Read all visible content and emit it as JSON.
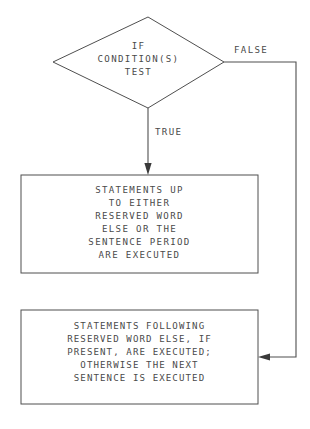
{
  "diagram": {
    "type": "flowchart",
    "background_color": "#ffffff",
    "line_color": "#4f4f4f",
    "text_color": "#4a4a4a",
    "decision": {
      "shape": "diamond",
      "lines": [
        "IF",
        "CONDITION(S)",
        "TEST"
      ],
      "text": "IF\nCONDITION(S)\nTEST"
    },
    "edges": {
      "true_label": "TRUE",
      "false_label": "FALSE"
    },
    "process_top": {
      "shape": "rectangle",
      "lines": [
        "STATEMENTS UP",
        "TO EITHER",
        "RESERVED WORD",
        "ELSE OR THE",
        "SENTENCE PERIOD",
        "ARE EXECUTED"
      ],
      "text": "STATEMENTS UP\nTO EITHER\nRESERVED WORD\nELSE OR THE\nSENTENCE PERIOD\nARE EXECUTED"
    },
    "process_bottom": {
      "shape": "rectangle",
      "lines": [
        "STATEMENTS FOLLOWING",
        "RESERVED WORD ELSE, IF",
        "PRESENT, ARE EXECUTED;",
        "OTHERWISE THE NEXT",
        "SENTENCE IS EXECUTED"
      ],
      "text": "STATEMENTS FOLLOWING\nRESERVED WORD ELSE, IF\nPRESENT, ARE EXECUTED;\nOTHERWISE THE NEXT\nSENTENCE IS EXECUTED"
    }
  }
}
